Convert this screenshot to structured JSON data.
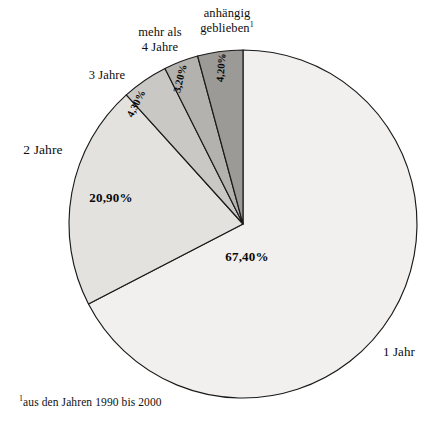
{
  "chart_data": {
    "type": "pie",
    "title": "",
    "subtitle": "",
    "xlabel": "",
    "ylabel": "",
    "legend_position": "none",
    "grid": false,
    "start_angle_deg": 0,
    "direction": "clockwise",
    "categories": [
      "1 Jahr",
      "2 Jahre",
      "3 Jahre",
      "mehr als 4 Jahre",
      "anhängig geblieben"
    ],
    "values": [
      67.4,
      20.9,
      4.3,
      3.2,
      4.2
    ],
    "value_labels": [
      "67,40%",
      "20,90%",
      "4,30%",
      "3,20%",
      "4,20%"
    ],
    "slice_colors": [
      "#f1f0ee",
      "#e3e2df",
      "#c9c8c5",
      "#b3b2af",
      "#9b9a97"
    ],
    "slice_border_color": "#1a1a1a",
    "slices": [
      {
        "name": "1 Jahr",
        "value": 67.4,
        "value_label": "67,40%",
        "category_label": "1 Jahr",
        "color": "#f1f0ee"
      },
      {
        "name": "2 Jahre",
        "value": 20.9,
        "value_label": "20,90%",
        "category_label": "2 Jahre",
        "color": "#e3e2df"
      },
      {
        "name": "3 Jahre",
        "value": 4.3,
        "value_label": "4,30%",
        "category_label": "3 Jahre",
        "color": "#c9c8c5"
      },
      {
        "name": "mehr als 4 Jahre",
        "value": 3.2,
        "value_label": "3,20%",
        "category_label_line1": "mehr als",
        "category_label_line2": "4 Jahre",
        "color": "#b3b2af"
      },
      {
        "name": "anhängig geblieben",
        "value": 4.2,
        "value_label": "4,20%",
        "category_label_line1": "anhängig",
        "category_label_line2": "geblieben",
        "category_label_superscript": "1",
        "color": "#9b9a97"
      }
    ]
  },
  "labels": {
    "one_year": "1 Jahr",
    "two_years": "2 Jahre",
    "three_years": "3 Jahre",
    "more_than_four_line1": "mehr als",
    "more_than_four_line2": "4 Jahre",
    "pending_line1": "anhängig",
    "pending_line2": "geblieben",
    "pending_superscript": "1"
  },
  "values": {
    "one_year_pct": "67,40%",
    "two_years_pct": "20,90%",
    "three_years_pct": "4,30%",
    "more_than_four_pct": "3,20%",
    "pending_pct": "4,20%"
  },
  "footnote": {
    "marker": "1",
    "text": "aus den Jahren 1990 bis 2000"
  }
}
